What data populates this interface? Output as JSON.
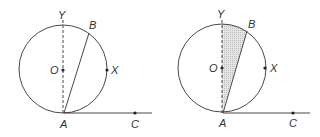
{
  "figures": [
    {
      "name": "left-figure",
      "shaded": false,
      "labels": {
        "Y": "Y",
        "B": "B",
        "O": "O",
        "X": "X",
        "A": "A",
        "C": "C"
      }
    },
    {
      "name": "right-figure",
      "shaded": true,
      "labels": {
        "Y": "Y",
        "B": "B",
        "O": "O",
        "X": "X",
        "A": "A",
        "C": "C"
      }
    }
  ],
  "colors": {
    "stroke": "#333333",
    "shade": "#d9d9d9"
  }
}
